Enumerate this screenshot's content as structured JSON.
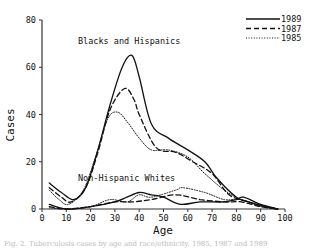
{
  "chart_data": {
    "type": "line",
    "title": "",
    "xlabel": "Age",
    "ylabel": "Cases",
    "xlim": [
      0,
      100
    ],
    "ylim": [
      0,
      80
    ],
    "x_ticks": [
      0,
      10,
      20,
      30,
      40,
      50,
      60,
      70,
      80,
      90,
      100
    ],
    "y_ticks": [
      0,
      20,
      40,
      60,
      80
    ],
    "grid": false,
    "legend_position": "top-right",
    "legend": [
      {
        "label": "1989",
        "style": "solid"
      },
      {
        "label": "1987",
        "style": "dashed"
      },
      {
        "label": "1985",
        "style": "dotted"
      }
    ],
    "annotations": [
      {
        "text": "Blacks and Hispanics",
        "x": 28,
        "y": 71
      },
      {
        "text": "Non-Hispanic Whites",
        "x": 27,
        "y": 12
      }
    ],
    "series": [
      {
        "name": "Blacks and Hispanics 1989",
        "group": "Blacks and Hispanics",
        "year": "1989",
        "style": "solid",
        "x": [
          3,
          8,
          13,
          18,
          23,
          28,
          33,
          37,
          40,
          45,
          52,
          60,
          67,
          72,
          80,
          85,
          92,
          97
        ],
        "y": [
          11,
          7,
          4,
          9,
          25,
          44,
          60,
          65,
          56,
          36,
          30,
          25,
          20,
          13,
          5,
          3,
          1,
          0
        ]
      },
      {
        "name": "Blacks and Hispanics 1987",
        "group": "Blacks and Hispanics",
        "year": "1987",
        "style": "dashed",
        "x": [
          3,
          8,
          12,
          18,
          23,
          28,
          34,
          38,
          40,
          47,
          55,
          62,
          70,
          77,
          85,
          92,
          97
        ],
        "y": [
          9,
          5,
          3,
          9,
          24,
          42,
          51,
          46,
          40,
          26,
          24,
          20,
          15,
          6,
          3,
          1,
          0
        ]
      },
      {
        "name": "Blacks and Hispanics 1985",
        "group": "Blacks and Hispanics",
        "year": "1985",
        "style": "dotted",
        "x": [
          3,
          7,
          11,
          17,
          22,
          27,
          31,
          35,
          40,
          45,
          52,
          60,
          67,
          75,
          82,
          92,
          97
        ],
        "y": [
          8,
          4,
          2,
          8,
          22,
          38,
          41,
          37,
          30,
          25,
          25,
          22,
          15,
          8,
          4,
          1,
          0
        ]
      },
      {
        "name": "Non-Hispanic Whites 1989",
        "group": "Non-Hispanic Whites",
        "year": "1989",
        "style": "solid",
        "x": [
          3,
          10,
          20,
          30,
          35,
          40,
          45,
          50,
          57,
          65,
          75,
          80,
          83,
          90,
          97
        ],
        "y": [
          2,
          0,
          1,
          3,
          5,
          7,
          6,
          5,
          2,
          3,
          3,
          4,
          5,
          2,
          0
        ]
      },
      {
        "name": "Non-Hispanic Whites 1987",
        "group": "Non-Hispanic Whites",
        "year": "1987",
        "style": "dashed",
        "x": [
          3,
          10,
          20,
          30,
          37,
          45,
          55,
          65,
          75,
          82,
          90,
          97
        ],
        "y": [
          1,
          0,
          1,
          3,
          3,
          4,
          6,
          4,
          3,
          3,
          1,
          0
        ]
      },
      {
        "name": "Non-Hispanic Whites 1985",
        "group": "Non-Hispanic Whites",
        "year": "1985",
        "style": "dotted",
        "x": [
          3,
          10,
          20,
          28,
          35,
          40,
          45,
          55,
          58,
          67,
          75,
          82,
          90,
          97
        ],
        "y": [
          0.5,
          0,
          1,
          4,
          3,
          6,
          5,
          8,
          9,
          7,
          4,
          4,
          1,
          0
        ]
      }
    ]
  },
  "caption": {
    "text": "Fig. 2. Tuberculosis cases by age and race/ethnicity, 1985, 1987 and 1989"
  }
}
